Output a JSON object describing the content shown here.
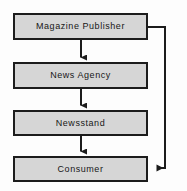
{
  "diagram": {
    "type": "flowchart",
    "canvas": {
      "width": 187,
      "height": 191
    },
    "style": {
      "box_fill": "#d6d6d6",
      "box_border": "#1c1c1c",
      "connector_color": "#1c1c1c",
      "background": "#fdfdfd",
      "text_color": "#161616"
    },
    "nodes": [
      {
        "id": "magazine-publisher",
        "label": "Magazine Publisher",
        "x": 13,
        "y": 13,
        "width": 135,
        "height": 27
      },
      {
        "id": "news-agency",
        "label": "News Agency",
        "x": 13,
        "y": 62,
        "width": 135,
        "height": 27
      },
      {
        "id": "newsstand",
        "label": "Newsstand",
        "x": 13,
        "y": 110,
        "width": 135,
        "height": 26
      },
      {
        "id": "consumer",
        "label": "Consumer",
        "x": 13,
        "y": 156,
        "width": 135,
        "height": 26
      }
    ],
    "connectors": [
      {
        "id": "publisher-to-agency",
        "from": "magazine-publisher",
        "to": "news-agency",
        "kind": "straight-down-arrow"
      },
      {
        "id": "agency-to-newsstand",
        "from": "news-agency",
        "to": "newsstand",
        "kind": "straight-down-arrow"
      },
      {
        "id": "newsstand-to-consumer",
        "from": "newsstand",
        "to": "consumer",
        "kind": "straight-down-arrow"
      },
      {
        "id": "publisher-to-consumer-feedback",
        "from": "magazine-publisher",
        "to": "consumer",
        "kind": "right-side-loop-arrow"
      }
    ]
  }
}
